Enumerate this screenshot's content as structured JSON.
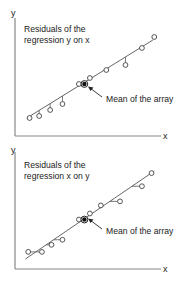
{
  "chart_data": [
    {
      "type": "scatter",
      "title": "",
      "xlabel": "x",
      "ylabel": "y",
      "annotation_lines": [
        "Residuals of the",
        "regression y on x"
      ],
      "mean_label": "Mean of the array",
      "residual_direction": "vertical",
      "xlim": [
        0,
        100
      ],
      "ylim": [
        0,
        100
      ],
      "regression_line": {
        "x0": 5,
        "y0": 10,
        "x1": 97,
        "y1": 88
      },
      "points": [
        {
          "x": 7,
          "y": 10
        },
        {
          "x": 14,
          "y": 12
        },
        {
          "x": 22,
          "y": 18
        },
        {
          "x": 31,
          "y": 24
        },
        {
          "x": 43,
          "y": 44
        },
        {
          "x": 51,
          "y": 50
        },
        {
          "x": 63,
          "y": 58
        },
        {
          "x": 77,
          "y": 63
        },
        {
          "x": 89,
          "y": 80
        },
        {
          "x": 98,
          "y": 91
        }
      ],
      "mean": {
        "x": 47,
        "y": 44
      }
    },
    {
      "type": "scatter",
      "title": "",
      "xlabel": "x",
      "ylabel": "y",
      "annotation_lines": [
        "Residuals of the",
        "regression x on y"
      ],
      "mean_label": "Mean of the array",
      "residual_direction": "horizontal",
      "xlim": [
        0,
        100
      ],
      "ylim": [
        0,
        100
      ],
      "regression_line": {
        "x0": 4,
        "y0": 5,
        "x1": 98,
        "y1": 92
      },
      "points": [
        {
          "x": 6,
          "y": 12
        },
        {
          "x": 16,
          "y": 12
        },
        {
          "x": 23,
          "y": 19
        },
        {
          "x": 31,
          "y": 24
        },
        {
          "x": 43,
          "y": 44
        },
        {
          "x": 51,
          "y": 50
        },
        {
          "x": 59,
          "y": 58
        },
        {
          "x": 73,
          "y": 62
        },
        {
          "x": 89,
          "y": 77
        },
        {
          "x": 96,
          "y": 90
        }
      ],
      "mean": {
        "x": 47,
        "y": 44
      }
    }
  ]
}
